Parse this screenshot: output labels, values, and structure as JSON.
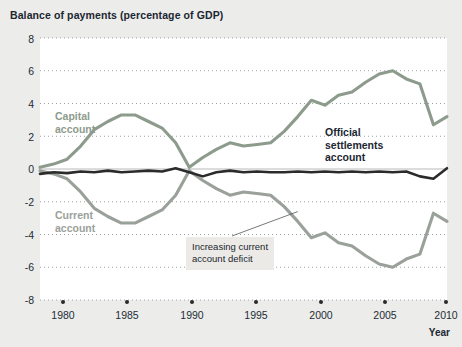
{
  "chart_data": {
    "type": "line",
    "title": "Balance of payments (percentage of GDP)",
    "xlabel": "Year",
    "ylabel": "",
    "xlim": [
      1980,
      2010
    ],
    "ylim": [
      -8,
      8
    ],
    "yticks": [
      "8",
      "6",
      "4",
      "2",
      "0",
      "-2",
      "-4",
      "-6",
      "-8"
    ],
    "xticks": [
      "1980",
      "1985",
      "1990",
      "1995",
      "2000",
      "2005",
      "2010"
    ],
    "grid": "dotted-horizontal",
    "legend_position": "inline-annotations",
    "x": [
      1980,
      1981,
      1982,
      1983,
      1984,
      1985,
      1986,
      1987,
      1988,
      1989,
      1990,
      1991,
      1992,
      1993,
      1994,
      1995,
      1996,
      1997,
      1998,
      1999,
      2000,
      2001,
      2002,
      2003,
      2004,
      2005,
      2006,
      2007,
      2008,
      2009,
      2010
    ],
    "series": [
      {
        "name": "Capital account",
        "color": "#8d9b8d",
        "values": [
          0.1,
          0.3,
          0.6,
          1.4,
          2.4,
          2.9,
          3.3,
          3.3,
          2.9,
          2.5,
          1.6,
          0.1,
          0.7,
          1.2,
          1.6,
          1.4,
          1.5,
          1.6,
          2.3,
          3.2,
          4.2,
          3.9,
          4.5,
          4.7,
          5.3,
          5.8,
          6.0,
          5.5,
          5.2,
          2.7,
          3.2
        ]
      },
      {
        "name": "Current account",
        "color": "#9aa09a",
        "values": [
          -0.1,
          -0.3,
          -0.6,
          -1.4,
          -2.4,
          -2.9,
          -3.3,
          -3.3,
          -2.9,
          -2.5,
          -1.6,
          -0.1,
          -0.7,
          -1.2,
          -1.6,
          -1.4,
          -1.5,
          -1.6,
          -2.3,
          -3.2,
          -4.2,
          -3.9,
          -4.5,
          -4.7,
          -5.3,
          -5.8,
          -6.0,
          -5.5,
          -5.2,
          -2.7,
          -3.2
        ]
      },
      {
        "name": "Official settlements account",
        "color": "#2b2b2b",
        "values": [
          -0.3,
          -0.2,
          -0.25,
          -0.15,
          -0.2,
          -0.1,
          -0.2,
          -0.15,
          -0.1,
          -0.15,
          0.05,
          -0.2,
          -0.45,
          -0.2,
          -0.1,
          -0.2,
          -0.15,
          -0.2,
          -0.2,
          -0.15,
          -0.2,
          -0.15,
          -0.2,
          -0.15,
          -0.2,
          -0.15,
          -0.2,
          -0.15,
          -0.45,
          -0.6,
          0.05
        ]
      }
    ],
    "annotations": [
      {
        "name": "increasing-current-account-deficit",
        "text_line1": "Increasing current",
        "text_line2": "account deficit",
        "points_to_x": 1999,
        "points_to_y": -2.6
      }
    ],
    "series_labels": {
      "capital_line1": "Capital",
      "capital_line2": "account",
      "current_line1": "Current",
      "current_line2": "account",
      "official_line1": "Official",
      "official_line2": "settlements",
      "official_line3": "account"
    }
  }
}
